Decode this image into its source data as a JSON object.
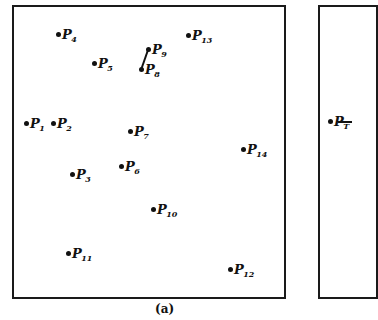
{
  "figure": {
    "caption": "(a)",
    "panel_a": {
      "points": [
        {
          "label": "P",
          "sub": "1",
          "x": 24,
          "y": 117
        },
        {
          "label": "P",
          "sub": "2",
          "x": 51,
          "y": 117
        },
        {
          "label": "P",
          "sub": "3",
          "x": 70,
          "y": 168
        },
        {
          "label": "P",
          "sub": "4",
          "x": 56,
          "y": 28
        },
        {
          "label": "P",
          "sub": "5",
          "x": 92,
          "y": 57
        },
        {
          "label": "P",
          "sub": "6",
          "x": 119,
          "y": 160
        },
        {
          "label": "P",
          "sub": "7",
          "x": 128,
          "y": 125
        },
        {
          "label": "P",
          "sub": "8",
          "x": 139,
          "y": 63
        },
        {
          "label": "P",
          "sub": "9",
          "x": 146,
          "y": 43
        },
        {
          "label": "P",
          "sub": "10",
          "x": 151,
          "y": 203
        },
        {
          "label": "P",
          "sub": "11",
          "x": 66,
          "y": 247
        },
        {
          "label": "P",
          "sub": "12",
          "x": 228,
          "y": 263
        },
        {
          "label": "P",
          "sub": "13",
          "x": 186,
          "y": 29
        },
        {
          "label": "P",
          "sub": "14",
          "x": 241,
          "y": 143
        }
      ],
      "edges": [
        {
          "from": "P8",
          "to": "P9",
          "x1": 141,
          "y1": 70,
          "x2": 148,
          "y2": 50
        }
      ]
    },
    "panel_b": {
      "points": [
        {
          "label": "P",
          "sub": "T",
          "x": 328,
          "y": 115
        }
      ],
      "edges": [
        {
          "from": "PT",
          "to": "right",
          "x1": 338,
          "y1": 122,
          "x2": 352,
          "y2": 122
        }
      ]
    }
  }
}
